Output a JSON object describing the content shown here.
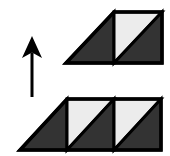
{
  "figure": {
    "background_color": "#ffffff",
    "width": 170,
    "height": 156,
    "palette": {
      "outline": "#000000",
      "dark_fill": "#333333",
      "light_fill": "#ececec",
      "arrow_color": "#000000"
    },
    "arrow": {
      "name": "up-arrow",
      "direction": "up",
      "tip_x": 32,
      "tip_y": 36,
      "tail_y": 97,
      "shaft_width": 3,
      "head_width": 20,
      "head_height": 22,
      "color": "#000000"
    },
    "shapes": [
      {
        "id": "top-figure",
        "label": "Top shape: one slanted triangle plus one split square",
        "x": 66,
        "y": 12,
        "width": 96,
        "height": 51,
        "unit": 48,
        "cells": [
          {
            "type": "left-triangle",
            "fill": "dark_fill"
          },
          {
            "type": "split-square",
            "upper_fill": "light_fill",
            "lower_fill": "dark_fill"
          }
        ]
      },
      {
        "id": "bottom-figure",
        "label": "Bottom shape: one slanted triangle plus two split squares",
        "x": 20,
        "y": 99,
        "width": 142,
        "height": 51,
        "unit": 47,
        "cells": [
          {
            "type": "left-triangle",
            "fill": "dark_fill"
          },
          {
            "type": "split-square",
            "upper_fill": "light_fill",
            "lower_fill": "dark_fill"
          },
          {
            "type": "split-square",
            "upper_fill": "light_fill",
            "lower_fill": "dark_fill"
          }
        ]
      }
    ]
  }
}
